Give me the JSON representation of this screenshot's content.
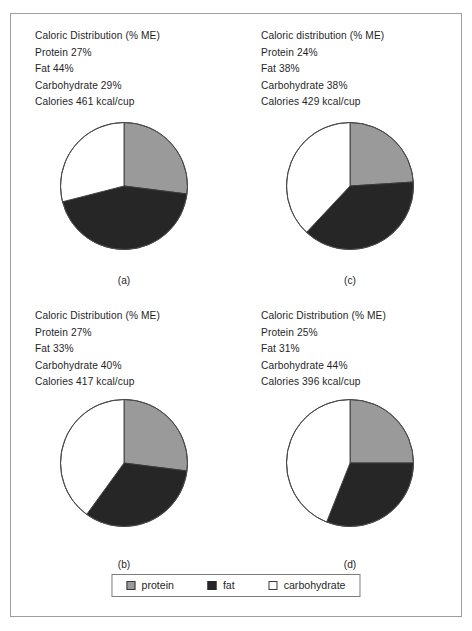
{
  "figure": {
    "legend": {
      "items": [
        {
          "key": "protein",
          "label": "protein",
          "color": "#9a9a9a"
        },
        {
          "key": "fat",
          "label": "fat",
          "color": "#262626"
        },
        {
          "key": "carbohydrate",
          "label": "carbohydrate",
          "color": "#ffffff"
        }
      ]
    },
    "panels": [
      {
        "id": "a",
        "label": "(a)",
        "heading": "Caloric Distribution (% ME)",
        "protein_line": "Protein 27%",
        "fat_line": "Fat 44%",
        "carbohydrate_line": "Carbohydrate 29%",
        "calories_line": "Calories 461 kcal/cup"
      },
      {
        "id": "c",
        "label": "(c)",
        "heading": "Caloric distribution (% ME)",
        "protein_line": "Protein 24%",
        "fat_line": "Fat 38%",
        "carbohydrate_line": "Carbohydrate 38%",
        "calories_line": "Calories 429 kcal/cup"
      },
      {
        "id": "b",
        "label": "(b)",
        "heading": "Caloric Distribution (% ME)",
        "protein_line": "Protein 27%",
        "fat_line": "Fat 33%",
        "carbohydrate_line": "Carbohydrate 40%",
        "calories_line": "Calories 417 kcal/cup"
      },
      {
        "id": "d",
        "label": "(d)",
        "heading": "Caloric Distribution (% ME)",
        "protein_line": "Protein 25%",
        "fat_line": "Fat 31%",
        "carbohydrate_line": "Carbohydrate 44%",
        "calories_line": "Calories 396 kcal/cup"
      }
    ]
  },
  "chart_data": [
    {
      "type": "pie",
      "id": "a",
      "title": "Caloric Distribution (% ME)",
      "labels": [
        "protein",
        "fat",
        "carbohydrate"
      ],
      "values": [
        27,
        44,
        29
      ],
      "colors": [
        "#9a9a9a",
        "#262626",
        "#ffffff"
      ],
      "unit": "% ME",
      "start_angle_deg": 0,
      "direction": "clockwise",
      "annotations": {
        "calories": 461,
        "calories_unit": "kcal/cup"
      },
      "legend_position": "figure-bottom"
    },
    {
      "type": "pie",
      "id": "c",
      "title": "Caloric distribution (% ME)",
      "labels": [
        "protein",
        "fat",
        "carbohydrate"
      ],
      "values": [
        24,
        38,
        38
      ],
      "colors": [
        "#9a9a9a",
        "#262626",
        "#ffffff"
      ],
      "unit": "% ME",
      "start_angle_deg": 0,
      "direction": "clockwise",
      "annotations": {
        "calories": 429,
        "calories_unit": "kcal/cup"
      },
      "legend_position": "figure-bottom"
    },
    {
      "type": "pie",
      "id": "b",
      "title": "Caloric Distribution (% ME)",
      "labels": [
        "protein",
        "fat",
        "carbohydrate"
      ],
      "values": [
        27,
        33,
        40
      ],
      "colors": [
        "#9a9a9a",
        "#262626",
        "#ffffff"
      ],
      "unit": "% ME",
      "start_angle_deg": 0,
      "direction": "clockwise",
      "annotations": {
        "calories": 417,
        "calories_unit": "kcal/cup"
      },
      "legend_position": "figure-bottom"
    },
    {
      "type": "pie",
      "id": "d",
      "title": "Caloric Distribution (% ME)",
      "labels": [
        "protein",
        "fat",
        "carbohydrate"
      ],
      "values": [
        25,
        31,
        44
      ],
      "colors": [
        "#9a9a9a",
        "#262626",
        "#ffffff"
      ],
      "unit": "% ME",
      "start_angle_deg": 0,
      "direction": "clockwise",
      "annotations": {
        "calories": 396,
        "calories_unit": "kcal/cup"
      },
      "legend_position": "figure-bottom"
    }
  ]
}
